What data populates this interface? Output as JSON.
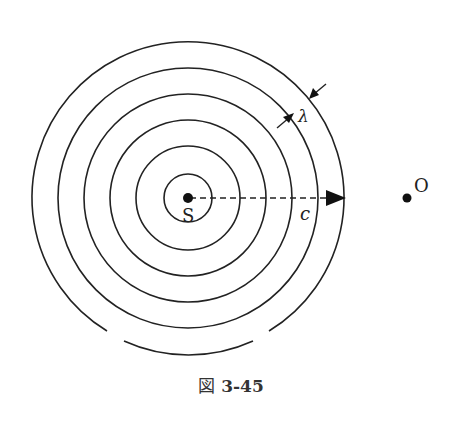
{
  "diagram": {
    "type": "concentric wavefronts",
    "source": {
      "label": "S",
      "cx": 188,
      "cy": 198
    },
    "observer": {
      "label": "O",
      "cx": 407,
      "cy": 198
    },
    "wavefront_radii": [
      24,
      52,
      78,
      104,
      130,
      156
    ],
    "velocity_label": "c",
    "wavelength_label": "λ"
  },
  "caption": {
    "prefix": "図",
    "number": "3-45"
  },
  "colors": {
    "stroke": "#222222",
    "background": "#ffffff"
  }
}
